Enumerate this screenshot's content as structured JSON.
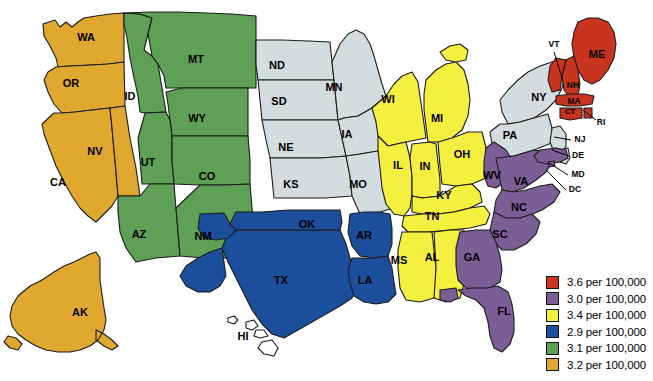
{
  "map": {
    "title": "United States choropleth map",
    "palette": {
      "red": "#C8341E",
      "purple": "#7B5E96",
      "yellow": "#F5EF40",
      "blue": "#1B4F9C",
      "green": "#5EA055",
      "orange": "#E0A82E",
      "gray": "#D3DCE0",
      "outline": "#1b1b1b",
      "background": "#FFFFFF"
    },
    "states": [
      {
        "code": "WA",
        "group": "orange",
        "label_x": 86,
        "label_y": 38,
        "size": "normal"
      },
      {
        "code": "OR",
        "group": "orange",
        "label_x": 71,
        "label_y": 84,
        "size": "normal"
      },
      {
        "code": "CA",
        "group": "orange",
        "label_x": 58,
        "label_y": 183,
        "size": "normal"
      },
      {
        "code": "NV",
        "group": "orange",
        "label_x": 95,
        "label_y": 152,
        "size": "normal"
      },
      {
        "code": "AK",
        "group": "orange",
        "label_x": 80,
        "label_y": 313,
        "size": "normal"
      },
      {
        "code": "ID",
        "group": "green",
        "label_x": 130,
        "label_y": 97,
        "size": "normal"
      },
      {
        "code": "MT",
        "group": "green",
        "label_x": 196,
        "label_y": 60,
        "size": "normal"
      },
      {
        "code": "WY",
        "group": "green",
        "label_x": 197,
        "label_y": 119,
        "size": "normal"
      },
      {
        "code": "UT",
        "group": "green",
        "label_x": 148,
        "label_y": 163,
        "size": "normal"
      },
      {
        "code": "CO",
        "group": "green",
        "label_x": 207,
        "label_y": 177,
        "size": "normal"
      },
      {
        "code": "AZ",
        "group": "green",
        "label_x": 139,
        "label_y": 235,
        "size": "normal"
      },
      {
        "code": "NM",
        "group": "green",
        "label_x": 203,
        "label_y": 237,
        "size": "normal"
      },
      {
        "code": "ND",
        "group": "gray",
        "label_x": 277,
        "label_y": 66,
        "size": "normal"
      },
      {
        "code": "SD",
        "group": "gray",
        "label_x": 279,
        "label_y": 102,
        "size": "normal"
      },
      {
        "code": "NE",
        "group": "gray",
        "label_x": 286,
        "label_y": 148,
        "size": "normal"
      },
      {
        "code": "KS",
        "group": "gray",
        "label_x": 291,
        "label_y": 185,
        "size": "normal"
      },
      {
        "code": "MN",
        "group": "gray",
        "label_x": 334,
        "label_y": 88,
        "size": "normal"
      },
      {
        "code": "IA",
        "group": "gray",
        "label_x": 347,
        "label_y": 135,
        "size": "normal"
      },
      {
        "code": "MO",
        "group": "gray",
        "label_x": 358,
        "label_y": 185,
        "size": "normal"
      },
      {
        "code": "NY",
        "group": "gray",
        "label_x": 539,
        "label_y": 98,
        "size": "normal"
      },
      {
        "code": "PA",
        "group": "gray",
        "label_x": 510,
        "label_y": 136,
        "size": "normal"
      },
      {
        "code": "WI",
        "group": "yellow",
        "label_x": 388,
        "label_y": 100,
        "size": "normal"
      },
      {
        "code": "MI",
        "group": "yellow",
        "label_x": 437,
        "label_y": 119,
        "size": "normal"
      },
      {
        "code": "IL",
        "group": "yellow",
        "label_x": 398,
        "label_y": 166,
        "size": "normal"
      },
      {
        "code": "IN",
        "group": "yellow",
        "label_x": 425,
        "label_y": 167,
        "size": "normal"
      },
      {
        "code": "OH",
        "group": "yellow",
        "label_x": 462,
        "label_y": 155,
        "size": "normal"
      },
      {
        "code": "KY",
        "group": "yellow",
        "label_x": 444,
        "label_y": 196,
        "size": "normal"
      },
      {
        "code": "TN",
        "group": "yellow",
        "label_x": 432,
        "label_y": 217,
        "size": "normal"
      },
      {
        "code": "MS",
        "group": "yellow",
        "label_x": 399,
        "label_y": 261,
        "size": "normal"
      },
      {
        "code": "AL",
        "group": "yellow",
        "label_x": 432,
        "label_y": 258,
        "size": "normal"
      },
      {
        "code": "TX",
        "group": "blue",
        "label_x": 281,
        "label_y": 281,
        "size": "normal"
      },
      {
        "code": "OK",
        "group": "blue",
        "label_x": 307,
        "label_y": 225,
        "size": "normal"
      },
      {
        "code": "AR",
        "group": "blue",
        "label_x": 364,
        "label_y": 236,
        "size": "normal"
      },
      {
        "code": "LA",
        "group": "blue",
        "label_x": 365,
        "label_y": 281,
        "size": "normal"
      },
      {
        "code": "WV",
        "group": "purple",
        "label_x": 492,
        "label_y": 176,
        "size": "normal"
      },
      {
        "code": "VA",
        "group": "purple",
        "label_x": 521,
        "label_y": 182,
        "size": "normal"
      },
      {
        "code": "NC",
        "group": "purple",
        "label_x": 519,
        "label_y": 208,
        "size": "normal"
      },
      {
        "code": "SC",
        "group": "purple",
        "label_x": 500,
        "label_y": 235,
        "size": "normal"
      },
      {
        "code": "GA",
        "group": "purple",
        "label_x": 472,
        "label_y": 258,
        "size": "normal"
      },
      {
        "code": "FL",
        "group": "purple",
        "label_x": 504,
        "label_y": 312,
        "size": "normal"
      },
      {
        "code": "ME",
        "group": "red",
        "label_x": 597,
        "label_y": 55,
        "size": "normal"
      },
      {
        "code": "NH",
        "group": "red",
        "label_x": 573,
        "label_y": 86,
        "size": "small"
      },
      {
        "code": "VT",
        "group": "red",
        "label_x": 554,
        "label_y": 45,
        "size": "small"
      },
      {
        "code": "MA",
        "group": "red",
        "label_x": 574,
        "label_y": 102,
        "size": "small"
      },
      {
        "code": "CT",
        "group": "red",
        "label_x": 570,
        "label_y": 112,
        "size": "tiny"
      },
      {
        "code": "RI",
        "group": "red",
        "label_x": 601,
        "label_y": 123,
        "size": "small"
      },
      {
        "code": "NJ",
        "group": "gray",
        "label_x": 580,
        "label_y": 140,
        "size": "small"
      },
      {
        "code": "DE",
        "group": "gray",
        "label_x": 578,
        "label_y": 156,
        "size": "small"
      },
      {
        "code": "MD",
        "group": "purple",
        "label_x": 578,
        "label_y": 175,
        "size": "small"
      },
      {
        "code": "DC",
        "group": "purple",
        "label_x": 575,
        "label_y": 190,
        "size": "small"
      },
      {
        "code": "HI",
        "group": "none",
        "label_x": 243,
        "label_y": 337,
        "size": "normal"
      }
    ]
  },
  "legend": {
    "title": "Rate legend",
    "entries": [
      {
        "color": "#C8341E",
        "label": "3.6 per 100,000",
        "value": 3.6,
        "group": "red"
      },
      {
        "color": "#7B5E96",
        "label": "3.0 per 100,000",
        "value": 3.0,
        "group": "purple"
      },
      {
        "color": "#F5EF40",
        "label": "3.4 per 100,000",
        "value": 3.4,
        "group": "yellow"
      },
      {
        "color": "#1B4F9C",
        "label": "2.9 per 100,000",
        "value": 2.9,
        "group": "blue"
      },
      {
        "color": "#5EA055",
        "label": "3.1 per 100,000",
        "value": 3.1,
        "group": "green"
      },
      {
        "color": "#E0A82E",
        "label": "3.2 per 100,000",
        "value": 3.2,
        "group": "orange"
      }
    ]
  }
}
